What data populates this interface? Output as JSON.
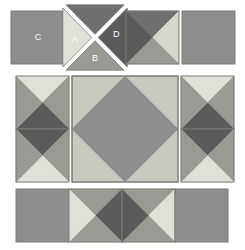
{
  "diagram": {
    "type": "quilt-block-construction",
    "background": "#ffffff",
    "palette": {
      "light": "#e8e8e2",
      "medium_light": "#c9c9c0",
      "medium": "#8e8e8e",
      "medium_dark": "#6f6f6f",
      "dark": "#5a5a5a",
      "label_text": "#ffffff",
      "outline": "#7a7a74"
    },
    "labels": {
      "a": "A",
      "b": "B",
      "c": "C",
      "d": "D"
    },
    "rows": [
      {
        "name": "top-row",
        "units": [
          {
            "name": "solid-square-c",
            "kind": "solid",
            "label": "C",
            "x": 11,
            "y": 11,
            "w": 53,
            "h": 53,
            "fill": "#8e8e8e",
            "label_x": 38,
            "label_y": 38
          },
          {
            "name": "exploded-quarter-square",
            "kind": "exploded-quarter-square",
            "x": 66,
            "y": 8,
            "w": 58,
            "h": 59,
            "triangles": [
              {
                "name": "triangle-a",
                "position": "left",
                "fill": "#e0e0d8",
                "label": "A",
                "label_x": 78,
                "label_y": 40
              },
              {
                "name": "triangle-top",
                "position": "top",
                "fill": "#6f6f6f",
                "label": "",
                "label_x": 95,
                "label_y": 22
              },
              {
                "name": "triangle-b",
                "position": "bottom",
                "fill": "#9a9a94",
                "label": "B",
                "label_x": 95,
                "label_y": 55
              },
              {
                "name": "triangle-d",
                "position": "right",
                "fill": "#5a5a5a",
                "label": "D",
                "label_x": 113,
                "label_y": 35
              }
            ]
          },
          {
            "name": "assembled-quarter-square",
            "kind": "quarter-square",
            "x": 126,
            "y": 11,
            "w": 53,
            "h": 53,
            "fills": {
              "top": "#6f6f6f",
              "right": "#d6d6ce",
              "bottom": "#9a9a94",
              "left": "#5a5a5a"
            }
          },
          {
            "name": "solid-square-plain",
            "kind": "solid",
            "x": 182,
            "y": 11,
            "w": 53,
            "h": 53,
            "fill": "#8e8e8e"
          }
        ]
      },
      {
        "name": "middle-row",
        "units": [
          {
            "name": "left-side-unit-top",
            "kind": "quarter-square",
            "x": 16,
            "y": 76,
            "w": 53,
            "h": 53,
            "fills": {
              "top": "#e0e0d8",
              "right": "#9a9a94",
              "bottom": "#5a5a5a",
              "left": "#9a9a94"
            }
          },
          {
            "name": "left-side-unit-bottom",
            "kind": "quarter-square",
            "x": 16,
            "y": 129,
            "w": 53,
            "h": 53,
            "fills": {
              "top": "#5a5a5a",
              "right": "#9a9a94",
              "bottom": "#e0e0d8",
              "left": "#9a9a94"
            }
          },
          {
            "name": "center-square-in-square",
            "kind": "square-in-square",
            "x": 72,
            "y": 76,
            "w": 106,
            "h": 106,
            "background_fill": "#c9c9c0",
            "diamond_fill": "#8e8e8e"
          },
          {
            "name": "right-side-unit-top",
            "kind": "quarter-square",
            "x": 181,
            "y": 76,
            "w": 53,
            "h": 53,
            "fills": {
              "top": "#e0e0d8",
              "right": "#9a9a94",
              "bottom": "#5a5a5a",
              "left": "#9a9a94"
            }
          },
          {
            "name": "right-side-unit-bottom",
            "kind": "quarter-square",
            "x": 181,
            "y": 129,
            "w": 53,
            "h": 53,
            "fills": {
              "top": "#5a5a5a",
              "right": "#9a9a94",
              "bottom": "#e0e0d8",
              "left": "#9a9a94"
            }
          }
        ]
      },
      {
        "name": "bottom-row",
        "units": [
          {
            "name": "bottom-corner-square-left",
            "kind": "solid",
            "x": 16,
            "y": 189,
            "w": 53,
            "h": 53,
            "fill": "#8e8e8e"
          },
          {
            "name": "bottom-unit-left",
            "kind": "quarter-square",
            "x": 69,
            "y": 189,
            "w": 53,
            "h": 53,
            "fills": {
              "top": "#9a9a94",
              "right": "#5a5a5a",
              "bottom": "#9a9a94",
              "left": "#e0e0d8"
            }
          },
          {
            "name": "bottom-unit-right",
            "kind": "quarter-square",
            "x": 122,
            "y": 189,
            "w": 53,
            "h": 53,
            "fills": {
              "top": "#9a9a94",
              "right": "#e0e0d8",
              "bottom": "#9a9a94",
              "left": "#5a5a5a"
            }
          },
          {
            "name": "bottom-corner-square-right",
            "kind": "solid",
            "x": 175,
            "y": 189,
            "w": 53,
            "h": 53,
            "fill": "#8e8e8e"
          }
        ]
      }
    ]
  }
}
